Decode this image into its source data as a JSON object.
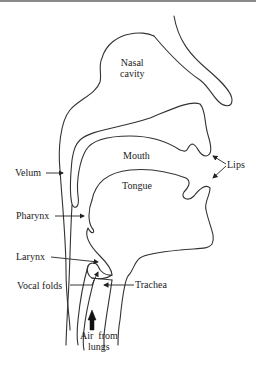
{
  "diagram": {
    "title": "",
    "labels": {
      "nasal_cavity": [
        "Nasal",
        "cavity"
      ],
      "mouth": "Mouth",
      "tongue": "Tongue",
      "lips": "Lips",
      "velum": "Velum",
      "pharynx": "Pharynx",
      "larynx": "Larynx",
      "vocal_folds": "Vocal folds",
      "trachea": "Trachea",
      "air_from_lungs": [
        "Air  from",
        "lungs"
      ]
    },
    "colors": {
      "line": "#333333",
      "text": "#222222",
      "background": "#ffffff",
      "top_border": "#8a8a8a"
    }
  }
}
